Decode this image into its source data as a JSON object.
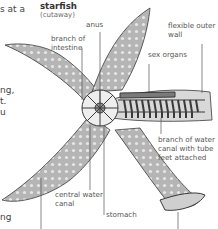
{
  "diagram": {
    "title": "starfish",
    "subtitle": "(cutaway)",
    "labels": {
      "anus": "anus",
      "branch_of_intestine_1": "branch of",
      "branch_of_intestine_2": "intestine",
      "flexible_outer_wall_1": "flexible outer",
      "flexible_outer_wall_2": "wall",
      "sex_organs": "sex organs",
      "branch_water_canal_1": "branch of water",
      "branch_water_canal_2": "canal with tube",
      "branch_water_canal_3": "feet attached",
      "central_water_canal_1": "central water",
      "central_water_canal_2": "canal",
      "stomach": "stomach"
    },
    "colors": {
      "body_fill": "#b9b9b9",
      "outline": "#3a3a3a",
      "leader_line": "#555555",
      "text": "#555555"
    }
  },
  "body_text_fragments": {
    "line1": "s at a",
    "line2": "ng,",
    "line3": "t.",
    "line4": "u",
    "line5": "ng"
  }
}
